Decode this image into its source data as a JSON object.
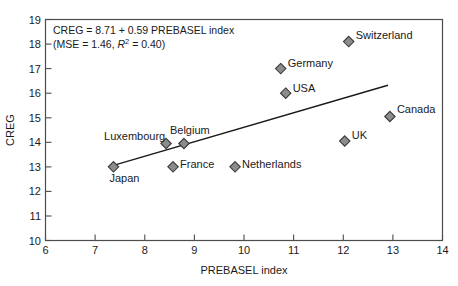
{
  "chart_data": {
    "type": "scatter",
    "title": "",
    "xlabel": "PREBASEL index",
    "ylabel": "CREG",
    "xlim": [
      6,
      14
    ],
    "ylim": [
      10,
      19
    ],
    "xticks": [
      6,
      7,
      8,
      9,
      10,
      11,
      12,
      13,
      14
    ],
    "yticks": [
      10,
      11,
      12,
      13,
      14,
      15,
      16,
      17,
      18,
      19
    ],
    "grid": false,
    "legend": "none",
    "points": [
      {
        "label": "Japan",
        "x": 7.37,
        "y": 13.0,
        "label_dx": -4,
        "label_dy": 15,
        "anchor": "start"
      },
      {
        "label": "Luxembourg",
        "x": 8.43,
        "y": 13.95,
        "label_dx": -62,
        "label_dy": -4,
        "anchor": "start"
      },
      {
        "label": "Belgium",
        "x": 8.79,
        "y": 13.95,
        "label_dx": -14,
        "label_dy": -10,
        "anchor": "start"
      },
      {
        "label": "France",
        "x": 8.57,
        "y": 13.0,
        "label_dx": 7,
        "label_dy": 1,
        "anchor": "start"
      },
      {
        "label": "Netherlands",
        "x": 9.82,
        "y": 13.0,
        "label_dx": 7,
        "label_dy": 1,
        "anchor": "start"
      },
      {
        "label": "Germany",
        "x": 10.74,
        "y": 17.0,
        "label_dx": 7,
        "label_dy": -2,
        "anchor": "start"
      },
      {
        "label": "USA",
        "x": 10.84,
        "y": 16.0,
        "label_dx": 7,
        "label_dy": -1,
        "anchor": "start"
      },
      {
        "label": "Switzerland",
        "x": 12.11,
        "y": 18.1,
        "label_dx": 7,
        "label_dy": -3,
        "anchor": "start"
      },
      {
        "label": "UK",
        "x": 12.03,
        "y": 14.05,
        "label_dx": 7,
        "label_dy": -2,
        "anchor": "start"
      },
      {
        "label": "Canada",
        "x": 12.94,
        "y": 15.05,
        "label_dx": 7,
        "label_dy": -3,
        "anchor": "start"
      }
    ],
    "fit_line": {
      "intercept": 8.71,
      "slope": 0.59,
      "x_start": 7.37,
      "x_end": 12.9
    },
    "annotation": {
      "line1": "CREG = 8.71 + 0.59 PREBASEL index",
      "line2_prefix": "(MSE = 1.46, ",
      "line2_italic": "R",
      "line2_sup": "2",
      "line2_suffix": " = 0.40)"
    }
  },
  "axes": {
    "x_title": "PREBASEL index",
    "y_title": "CREG"
  }
}
